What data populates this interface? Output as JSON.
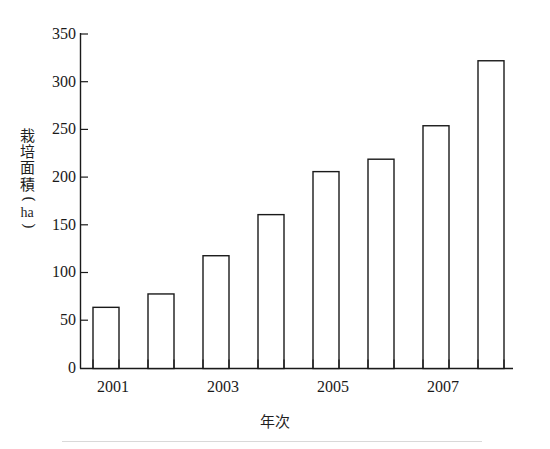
{
  "chart_data": {
    "type": "bar",
    "title": "",
    "subtitle": "",
    "xlabel": "年次",
    "ylabel": "栽培面積（ha）",
    "ylabel_parts": {
      "chars": [
        "栽",
        "培",
        "面",
        "積"
      ],
      "paren_open": "(",
      "unit": "ha",
      "paren_close": ")"
    },
    "categories": [
      "2001",
      "2002",
      "2003",
      "2004",
      "2005",
      "2006",
      "2007",
      "2008"
    ],
    "tick_labels_x": [
      "2001",
      "2003",
      "2005",
      "2007"
    ],
    "values": [
      64,
      78,
      118,
      161,
      206,
      219,
      254,
      322
    ],
    "ylim": [
      0,
      350
    ],
    "yticks": [
      0,
      50,
      100,
      150,
      200,
      250,
      300,
      350
    ],
    "ytick_labels": [
      "0",
      "50",
      "100",
      "150",
      "200",
      "250",
      "300",
      "350"
    ],
    "grid": false,
    "legend": "none",
    "bar_style": {
      "fill": "#ffffff",
      "stroke": "#1a1a1a",
      "stroke_width": 1.4
    },
    "axis_color": "#1a1a1a",
    "background": "#ffffff"
  },
  "figure": {
    "name": "cultivation-area-by-year-bar-chart"
  }
}
